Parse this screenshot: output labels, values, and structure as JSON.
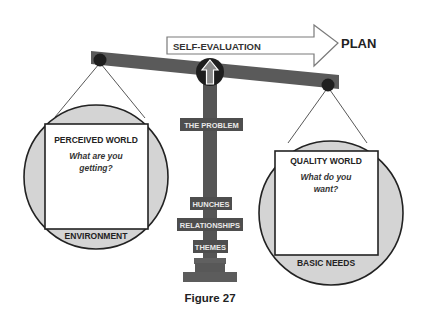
{
  "diagram": {
    "arrow": {
      "label": "SELF-EVALUATION",
      "target": "PLAN"
    },
    "pillar_labels": [
      "THE PROBLEM",
      "HUNCHES",
      "RELATIONSHIPS",
      "THEMES"
    ],
    "left_pan": {
      "title": "PERCEIVED WORLD",
      "question_line1": "What are you",
      "question_line2": "getting?",
      "footer": "ENVIRONMENT"
    },
    "right_pan": {
      "title": "QUALITY WORLD",
      "question_line1": "What do you",
      "question_line2": "want?",
      "footer": "BASIC NEEDS"
    },
    "caption": "Figure 27",
    "colors": {
      "beam": "#5a5a5a",
      "pillar": "#555555",
      "pan_fill": "#d4d4d4",
      "label_box": "#4e4e4e",
      "label_text": "#e8e8e8",
      "dark": "#1e1e1e"
    }
  }
}
